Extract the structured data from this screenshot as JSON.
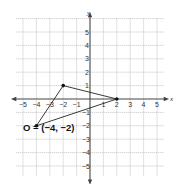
{
  "diagram": {
    "type": "coordinate-plane",
    "x_axis": {
      "label": "x",
      "min": -5,
      "max": 5,
      "tick_labels": [
        "-5",
        "-4",
        "-3",
        "-2",
        "-1",
        "1",
        "2",
        "3",
        "4",
        "5"
      ]
    },
    "y_axis": {
      "label": "y",
      "min": -5,
      "max": 5,
      "tick_labels": [
        "5",
        "4",
        "3",
        "2",
        "1",
        "-1",
        "-2",
        "-3",
        "-4",
        "-5"
      ]
    },
    "grid": true,
    "triangle": {
      "vertices": [
        {
          "x": -4,
          "y": -2
        },
        {
          "x": -2,
          "y": 1
        },
        {
          "x": 2,
          "y": 0
        }
      ]
    },
    "annotation": {
      "text": "O = (−4, −2)",
      "point": {
        "x": -4,
        "y": -2
      }
    },
    "colors": {
      "grid": "#9a9a9a",
      "axis": "#444444",
      "shape": "#222222"
    }
  }
}
